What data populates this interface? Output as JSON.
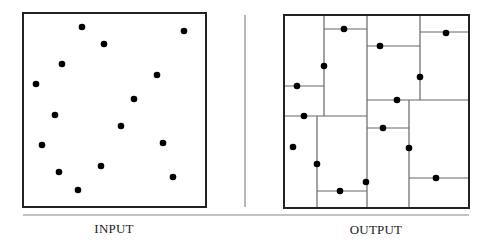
{
  "figure": {
    "labels": {
      "input": "INPUT",
      "output": "OUTPUT"
    },
    "colors": {
      "frame": "#222222",
      "partition_lines": "#666666",
      "points": "#000000",
      "separator": "#888888"
    },
    "input_panel": {
      "box": {
        "x": 23,
        "y": 13,
        "w": 183,
        "h": 194
      },
      "points": [
        [
          82,
          27
        ],
        [
          184,
          31
        ],
        [
          104,
          44
        ],
        [
          62,
          64
        ],
        [
          157,
          75
        ],
        [
          36,
          84
        ],
        [
          134,
          99
        ],
        [
          55,
          115
        ],
        [
          121,
          126
        ],
        [
          42,
          145
        ],
        [
          163,
          143
        ],
        [
          59,
          172
        ],
        [
          101,
          166
        ],
        [
          173,
          177
        ],
        [
          78,
          190
        ]
      ]
    },
    "output_panel": {
      "box": {
        "x": 284,
        "y": 15,
        "w": 185,
        "h": 193
      },
      "segments": [
        [
          324,
          15,
          324,
          116
        ],
        [
          367,
          15,
          367,
          208
        ],
        [
          324,
          29,
          367,
          29
        ],
        [
          284,
          86,
          324,
          86
        ],
        [
          284,
          116,
          367,
          116
        ],
        [
          317,
          116,
          317,
          208
        ],
        [
          317,
          191,
          367,
          191
        ],
        [
          367,
          46,
          420,
          46
        ],
        [
          420,
          15,
          420,
          100
        ],
        [
          420,
          32,
          469,
          32
        ],
        [
          367,
          100,
          469,
          100
        ],
        [
          409,
          100,
          409,
          208
        ],
        [
          367,
          128,
          409,
          128
        ],
        [
          409,
          178,
          469,
          178
        ]
      ],
      "points": [
        [
          344,
          29
        ],
        [
          324,
          66
        ],
        [
          297,
          86
        ],
        [
          304,
          116
        ],
        [
          293,
          147
        ],
        [
          317,
          164
        ],
        [
          340,
          191
        ],
        [
          366,
          182
        ],
        [
          380,
          46
        ],
        [
          446,
          33
        ],
        [
          420,
          77
        ],
        [
          397,
          100
        ],
        [
          383,
          128
        ],
        [
          409,
          148
        ],
        [
          436,
          178
        ]
      ]
    },
    "separator": {
      "x": 245,
      "y1": 15,
      "y2": 207
    },
    "baseline_rule": {
      "x1": 23,
      "x2": 469,
      "y": 215
    }
  }
}
